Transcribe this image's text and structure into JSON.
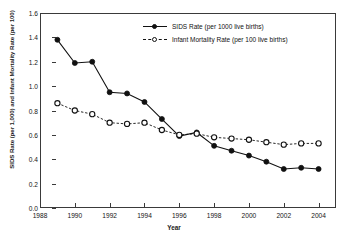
{
  "chart_data": {
    "type": "line",
    "title": "",
    "xlabel": "Year",
    "ylabel": "SIDS Rate (per 1,000) and Infant Mortality Rate (per 100)",
    "xlim": [
      1988,
      2005
    ],
    "ylim": [
      0.0,
      1.6
    ],
    "x_ticks": [
      1988,
      1990,
      1992,
      1994,
      1996,
      1998,
      2000,
      2002,
      2004
    ],
    "y_ticks": [
      "0.0",
      "0.2",
      "0.4",
      "0.6",
      "0.8",
      "1.0",
      "1.2",
      "1.4",
      "1.6"
    ],
    "grid": false,
    "legend_position": "upper-center",
    "x": [
      1989,
      1990,
      1991,
      1992,
      1993,
      1994,
      1995,
      1996,
      1997,
      1998,
      1999,
      2000,
      2001,
      2002,
      2003,
      2004
    ],
    "series": [
      {
        "name": "SIDS Rate (per 1000 live births)",
        "marker": "filled-circle",
        "line_style": "solid",
        "color": "#111111",
        "values": [
          1.38,
          1.19,
          1.2,
          0.95,
          0.94,
          0.87,
          0.73,
          0.59,
          0.62,
          0.51,
          0.47,
          0.43,
          0.38,
          0.32,
          0.33,
          0.32
        ]
      },
      {
        "name": "Infant Mortality Rate (per 100 live births)",
        "marker": "open-circle",
        "line_style": "dashed",
        "color": "#111111",
        "values": [
          0.86,
          0.8,
          0.77,
          0.7,
          0.69,
          0.7,
          0.64,
          0.6,
          0.61,
          0.58,
          0.57,
          0.56,
          0.54,
          0.52,
          0.53,
          0.53
        ]
      }
    ]
  },
  "axes": {
    "y_title": "SIDS Rate (per 1,000) and Infant Mortality Rate (per 100)",
    "x_title": "Year"
  },
  "legend": {
    "entries": [
      {
        "label": "SIDS Rate (per 1000 live births)",
        "marker": "filled-circle",
        "line": "solid"
      },
      {
        "label": "Infant Mortality Rate (per 100 live births)",
        "marker": "open-circle",
        "line": "dashed"
      }
    ]
  },
  "colors": {
    "series": "#111111",
    "axis": "#3a3a3a",
    "background": "#ffffff"
  }
}
